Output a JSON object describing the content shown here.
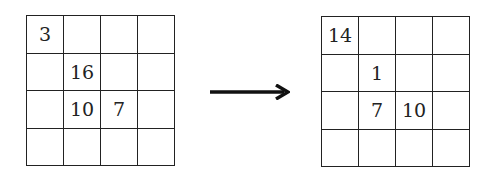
{
  "before": {
    "label": "Before",
    "cells": [
      [
        "3",
        "",
        "",
        ""
      ],
      [
        "",
        "16",
        "",
        ""
      ],
      [
        "",
        "10",
        "7",
        ""
      ],
      [
        "",
        "",
        "",
        ""
      ]
    ]
  },
  "after": {
    "label": "After",
    "cells": [
      [
        "14",
        "",
        "",
        ""
      ],
      [
        "",
        "1",
        "",
        ""
      ],
      [
        "",
        "7",
        "10",
        ""
      ],
      [
        "",
        "",
        "",
        ""
      ]
    ]
  },
  "arrow": {
    "icon": "right-arrow-icon",
    "direction": "right"
  }
}
